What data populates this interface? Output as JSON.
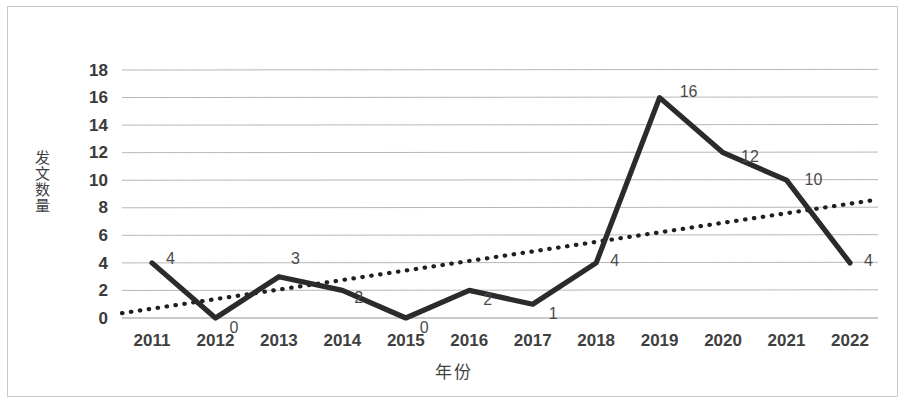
{
  "chart_data": {
    "type": "line",
    "title": "",
    "xlabel": "年份",
    "ylabel": "发文数量",
    "categories": [
      "2011",
      "2012",
      "2013",
      "2014",
      "2015",
      "2016",
      "2017",
      "2018",
      "2019",
      "2020",
      "2021",
      "2022"
    ],
    "series": [
      {
        "name": "发文数量",
        "values": [
          4,
          0,
          3,
          2,
          0,
          2,
          1,
          4,
          16,
          12,
          10,
          4
        ],
        "style": "solid",
        "color": "#2b2b2b",
        "data_labels": [
          "4",
          "0",
          "3",
          "2",
          "0",
          "2",
          "1",
          "4",
          "16",
          "12",
          "10",
          "4"
        ]
      },
      {
        "name": "趋势线",
        "values": [
          0.35,
          1.1,
          1.85,
          2.6,
          3.35,
          4.1,
          4.85,
          5.6,
          6.35,
          7.1,
          7.85,
          8.6
        ],
        "style": "dotted",
        "color": "#1f1f1f"
      }
    ],
    "ylim": [
      0,
      18
    ],
    "yticks": [
      "0",
      "2",
      "4",
      "6",
      "8",
      "10",
      "12",
      "14",
      "16",
      "18"
    ],
    "xtick_labels": [
      "2011",
      "2012",
      "2013",
      "2014",
      "2015",
      "2016",
      "2017",
      "2018",
      "2019",
      "2020",
      "2021",
      "2022"
    ],
    "grid": true,
    "grid_color": "#b7b7b7",
    "legend": "none",
    "background": "#ffffff",
    "border_color": "#c9c9c9"
  },
  "labels": {
    "y_0": "0",
    "y_2": "2",
    "y_4": "4",
    "y_6": "6",
    "y_8": "8",
    "y_10": "10",
    "y_12": "12",
    "y_14": "14",
    "y_16": "16",
    "y_18": "18"
  }
}
